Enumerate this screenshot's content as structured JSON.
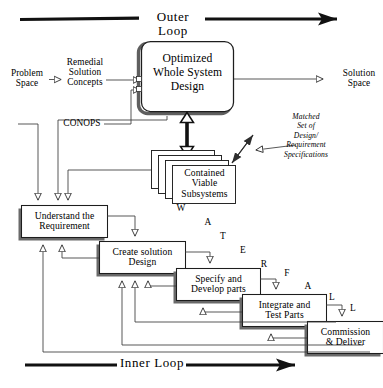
{
  "diagram": {
    "title_outer": "Outer Loop",
    "title_inner": "Inner Loop",
    "flows": {
      "problem_space": "Problem\nSpace",
      "remedial": "Remedial\nSolution\nConcepts",
      "conops": "CONOPS",
      "solution_space": "Solution\nSpace"
    },
    "boxes": {
      "optimized": "Optimized\nWhole System\nDesign",
      "subsystems": "Contained\nViable\nSubsystems",
      "understand": "Understand the\nRequirement",
      "create": "Create solution\nDesign",
      "specify": "Specify and\nDevelop parts",
      "integrate": "Integrate and\nTest Parts",
      "commission": "Commission\n& Deliver"
    },
    "annotation": {
      "matched_set": "Matched\nSet of\nDesign/\nRequirement\nSpecifications"
    },
    "waterfall_letters": [
      {
        "char": "W",
        "x": 175,
        "y": 203
      },
      {
        "char": "A",
        "x": 202,
        "y": 217
      },
      {
        "char": "T",
        "x": 217,
        "y": 231
      },
      {
        "char": "E",
        "x": 237,
        "y": 245
      },
      {
        "char": "R",
        "x": 258,
        "y": 259
      },
      {
        "char": "F",
        "x": 281,
        "y": 268
      },
      {
        "char": "A",
        "x": 302,
        "y": 281
      },
      {
        "char": "L",
        "x": 326,
        "y": 292
      },
      {
        "char": "L",
        "x": 347,
        "y": 303
      }
    ],
    "colors": {
      "ink": "#000000",
      "shadow": "#5a5a5a",
      "line": "#3a3a3a",
      "paper": "#ffffff"
    }
  }
}
